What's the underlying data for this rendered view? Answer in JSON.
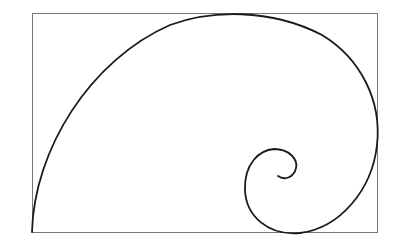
{
  "diagram": {
    "type": "golden-spiral",
    "background": "#ffffff",
    "frame": {
      "x": 32,
      "y": 13,
      "width": 345,
      "height": 219,
      "stroke": "#777777"
    },
    "spiral": {
      "stroke": "#1a1a1a",
      "width": 1.8
    }
  }
}
